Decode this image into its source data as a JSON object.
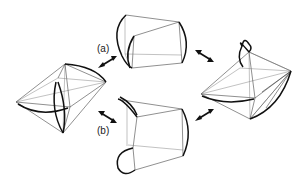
{
  "figure": {
    "background": "#ffffff",
    "line_color": "#111111",
    "labels": {
      "a": "(a)",
      "b": "(b)"
    },
    "shapes": [
      {
        "id": "left",
        "kind": "octahedron-like double pyramid with curved edges"
      },
      {
        "id": "top",
        "kind": "truncated pyramid with curved end edges"
      },
      {
        "id": "right",
        "kind": "octahedron-like double pyramid with curved loop"
      },
      {
        "id": "bottom",
        "kind": "truncated pyramid with curved loop edges"
      }
    ],
    "arrows": [
      {
        "from": "left",
        "to": "top",
        "label": "(a)",
        "type": "bidirectional"
      },
      {
        "from": "left",
        "to": "bottom",
        "label": "(b)",
        "type": "bidirectional"
      },
      {
        "from": "top",
        "to": "right",
        "label": "",
        "type": "bidirectional"
      },
      {
        "from": "bottom",
        "to": "right",
        "label": "",
        "type": "bidirectional"
      }
    ]
  }
}
